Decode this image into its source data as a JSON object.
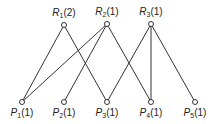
{
  "diagram": {
    "type": "bipartite-graph",
    "top_nodes": [
      {
        "id": "R1",
        "letter": "R",
        "sub": "1",
        "count": "(2)",
        "x": 64,
        "y": 25
      },
      {
        "id": "R2",
        "letter": "R",
        "sub": "2",
        "count": "(1)",
        "x": 107,
        "y": 24
      },
      {
        "id": "R3",
        "letter": "R",
        "sub": "3",
        "count": "(1)",
        "x": 151,
        "y": 24
      }
    ],
    "bottom_nodes": [
      {
        "id": "P1",
        "letter": "P",
        "sub": "1",
        "count": "(1)",
        "x": 22,
        "y": 102
      },
      {
        "id": "P2",
        "letter": "P",
        "sub": "2",
        "count": "(1)",
        "x": 64,
        "y": 102
      },
      {
        "id": "P3",
        "letter": "P",
        "sub": "3",
        "count": "(1)",
        "x": 107,
        "y": 102
      },
      {
        "id": "P4",
        "letter": "P",
        "sub": "4",
        "count": "(1)",
        "x": 151,
        "y": 102
      },
      {
        "id": "P5",
        "letter": "P",
        "sub": "5",
        "count": "(1)",
        "x": 195,
        "y": 102
      }
    ],
    "edges": [
      [
        "R1",
        "P1"
      ],
      [
        "R1",
        "P3"
      ],
      [
        "R2",
        "P1"
      ],
      [
        "R2",
        "P2"
      ],
      [
        "R2",
        "P4"
      ],
      [
        "R3",
        "P3"
      ],
      [
        "R3",
        "P4"
      ],
      [
        "R3",
        "P5"
      ]
    ],
    "colors": {
      "line": "#333333",
      "node_fill": "#ffffff"
    }
  }
}
